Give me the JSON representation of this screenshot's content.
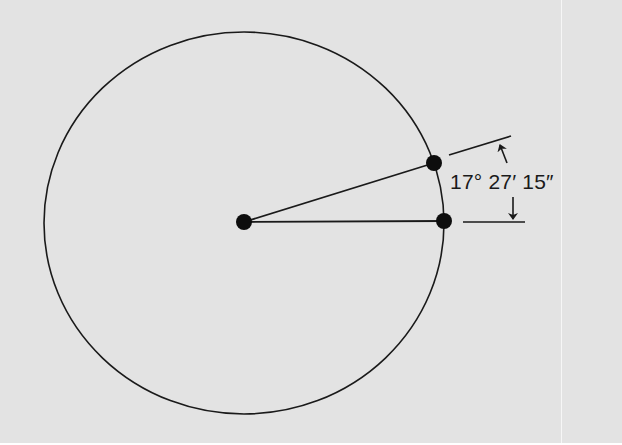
{
  "diagram": {
    "type": "circle-angle-measurement",
    "angle_label": "17° 27′ 15″",
    "colors": {
      "background": "#e3e3e3",
      "stroke": "#1a1a1a"
    },
    "circle": {
      "cx": 244,
      "cy": 223,
      "rx": 200,
      "ry": 191
    },
    "points": {
      "center": {
        "x": 244,
        "y": 222
      },
      "upper_point": {
        "x": 434,
        "y": 163
      },
      "right_point": {
        "x": 444,
        "y": 221
      }
    }
  }
}
